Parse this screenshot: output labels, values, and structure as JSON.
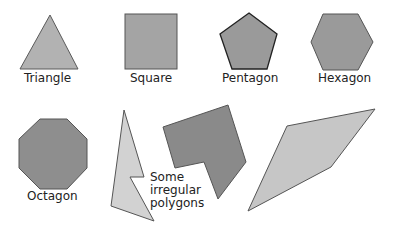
{
  "diagram": {
    "colors": {
      "light_fill": "#c6c6c6",
      "medium_fill": "#9e9e9e",
      "dark_fill": "#8a8a8a",
      "stroke": "#4a4a4a",
      "text": "#222222"
    },
    "shapes": [
      {
        "id": "triangle",
        "label": "Triangle"
      },
      {
        "id": "square",
        "label": "Square"
      },
      {
        "id": "pentagon",
        "label": "Pentagon"
      },
      {
        "id": "hexagon",
        "label": "Hexagon"
      },
      {
        "id": "octagon",
        "label": "Octagon"
      }
    ],
    "irregular_label": "Some\nirregular\npolygons"
  }
}
